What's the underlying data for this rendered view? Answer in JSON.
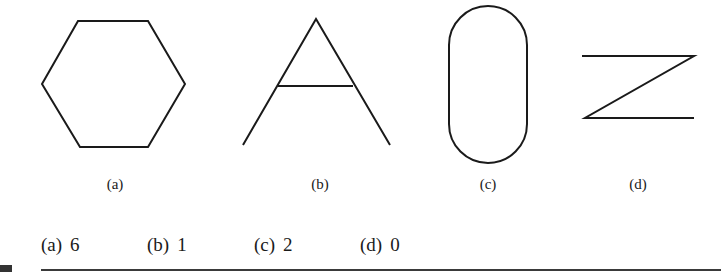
{
  "figures": [
    {
      "id": "a",
      "label": "(a)",
      "shape": "hexagon"
    },
    {
      "id": "b",
      "label": "(b)",
      "shape": "letter-A"
    },
    {
      "id": "c",
      "label": "(c)",
      "shape": "stadium"
    },
    {
      "id": "d",
      "label": "(d)",
      "shape": "letter-Z"
    }
  ],
  "answers": [
    {
      "option": "(a)",
      "value": "6"
    },
    {
      "option": "(b)",
      "value": "1"
    },
    {
      "option": "(c)",
      "value": "2"
    },
    {
      "option": "(d)",
      "value": "0"
    }
  ],
  "colors": {
    "stroke": "#1a1a1a",
    "rule": "#3a3a3a",
    "background": "#ffffff"
  }
}
